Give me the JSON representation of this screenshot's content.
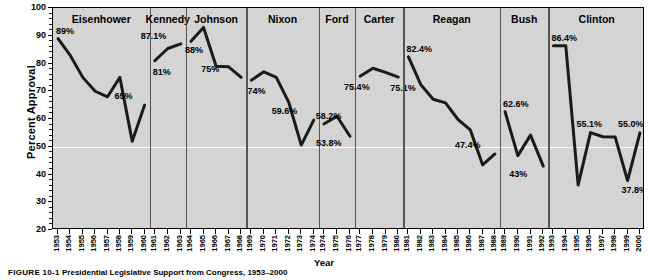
{
  "axis": {
    "ylabel": "Percent Approval",
    "xlabel": "Year",
    "yticks": [
      "100",
      "90",
      "80",
      "70",
      "60",
      "50",
      "40",
      "30",
      "20"
    ]
  },
  "caption": {
    "figure_number": "FIGURE 10-1",
    "text": "Presidential Legislative Support from Congress, 1953–2000"
  },
  "chart_data": {
    "type": "line",
    "title": "Presidential Legislative Support from Congress, 1953–2000",
    "xlabel": "Year",
    "ylabel": "Percent Approval",
    "ylim": [
      20,
      100
    ],
    "ytick_step": 10,
    "grid": false,
    "highlight_gridline": 50,
    "legend": "none",
    "line_color": "#1a1a1a",
    "panel_background": "#d4d4d4",
    "panels": [
      {
        "name": "Eisenhower",
        "years": [
          "1953",
          "1954",
          "1955",
          "1956",
          "1957",
          "1958",
          "1959",
          "1960"
        ],
        "values": [
          89,
          82.8,
          75,
          70,
          68,
          75,
          52,
          65
        ],
        "labels": [
          {
            "text": "89%",
            "year": "1953",
            "value": 89
          },
          {
            "text": "65%",
            "year": "1960",
            "value": 65
          }
        ]
      },
      {
        "name": "Kennedy",
        "years": [
          "1961",
          "1962",
          "1963"
        ],
        "values": [
          81,
          85.4,
          87.1
        ],
        "labels": [
          {
            "text": "81%",
            "year": "1961",
            "value": 81
          },
          {
            "text": "87.1%",
            "year": "1963",
            "value": 87.1
          }
        ]
      },
      {
        "name": "Johnson",
        "years": [
          "1964",
          "1965",
          "1966",
          "1967",
          "1968"
        ],
        "values": [
          88,
          93,
          79,
          78.8,
          75
        ],
        "labels": [
          {
            "text": "88%",
            "year": "1964",
            "value": 88
          },
          {
            "text": "75%",
            "year": "1968",
            "value": 75
          }
        ]
      },
      {
        "name": "Nixon",
        "years": [
          "1969",
          "1970",
          "1971",
          "1972",
          "1973",
          "1974"
        ],
        "values": [
          74,
          77,
          75,
          66,
          50.6,
          59.6
        ],
        "labels": [
          {
            "text": "74%",
            "year": "1969",
            "value": 74
          },
          {
            "text": "59.6%",
            "year": "1974",
            "value": 59.6
          }
        ]
      },
      {
        "name": "Ford",
        "years": [
          "1974",
          "1975",
          "1976"
        ],
        "values": [
          58.2,
          61,
          53.8
        ],
        "labels": [
          {
            "text": "58.2%",
            "year": "1974",
            "value": 58.2
          },
          {
            "text": "53.8%",
            "year": "1976",
            "value": 53.8
          }
        ]
      },
      {
        "name": "Carter",
        "years": [
          "1977",
          "1978",
          "1979",
          "1980"
        ],
        "values": [
          75.4,
          78.3,
          76.8,
          75.1
        ],
        "labels": [
          {
            "text": "75.4%",
            "year": "1977",
            "value": 75.4
          },
          {
            "text": "75.1%",
            "year": "1980",
            "value": 75.1
          }
        ]
      },
      {
        "name": "Reagan",
        "years": [
          "1981",
          "1982",
          "1983",
          "1984",
          "1985",
          "1986",
          "1987",
          "1988"
        ],
        "values": [
          82.4,
          72.4,
          67.1,
          65.8,
          59.9,
          56.1,
          43.5,
          47.4
        ],
        "labels": [
          {
            "text": "82.4%",
            "year": "1981",
            "value": 82.4
          },
          {
            "text": "47.4%",
            "year": "1988",
            "value": 47.4
          }
        ]
      },
      {
        "name": "Bush",
        "years": [
          "1989",
          "1990",
          "1991",
          "1992"
        ],
        "values": [
          62.6,
          46.8,
          54.2,
          43
        ],
        "labels": [
          {
            "text": "62.6%",
            "year": "1989",
            "value": 62.6
          },
          {
            "text": "43%",
            "year": "1992",
            "value": 43
          }
        ]
      },
      {
        "name": "Clinton",
        "years": [
          "1993",
          "1994",
          "1995",
          "1996",
          "1997",
          "1998",
          "1999",
          "2000"
        ],
        "values": [
          86.4,
          86.4,
          36.2,
          55.1,
          53.6,
          53.5,
          37.8,
          55.0
        ],
        "labels": [
          {
            "text": "86.4%",
            "year": "1993",
            "value": 86.4
          },
          {
            "text": "55.1%",
            "year": "1996",
            "value": 55.1
          },
          {
            "text": "55.0%",
            "year": "2000",
            "value": 55.0
          },
          {
            "text": "37.8%",
            "year": "1999",
            "value": 37.8
          }
        ]
      }
    ]
  }
}
